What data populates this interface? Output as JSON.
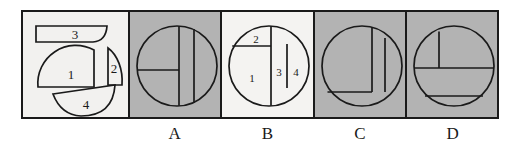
{
  "figure": {
    "type": "visual-puzzle",
    "colors": {
      "ink": "#1a1a1a",
      "paper": "#ffffff",
      "panel_light": "#f4f3f1",
      "panel_shaded": "#b3b3b3",
      "piece_fill": "#f2f1ef"
    }
  },
  "prompt_panel": {
    "name": "pieces-panel",
    "shaded": false,
    "pieces": [
      {
        "id": "piece-1",
        "label": "1",
        "shape": "quarter-disk-with-flat-right",
        "cx": 48,
        "cy": 62
      },
      {
        "id": "piece-2",
        "label": "2",
        "shape": "small-wedge",
        "cx": 92,
        "cy": 57
      },
      {
        "id": "piece-3",
        "label": "3",
        "shape": "thin-circular-segment",
        "cx": 52,
        "cy": 22
      },
      {
        "id": "piece-4",
        "label": "4",
        "shape": "circular-segment",
        "cx": 63,
        "cy": 94
      }
    ]
  },
  "options": [
    {
      "id": "option-a",
      "label": "A",
      "shaded": true,
      "circle": {
        "cx": 47,
        "cy": 54,
        "r": 40
      },
      "cuts": [
        {
          "kind": "vertical-chord",
          "x": 49,
          "note": "full chord just right of center"
        },
        {
          "kind": "horizontal-segment",
          "y": 58,
          "note": "from left circle edge to center chord"
        },
        {
          "kind": "vertical-chord",
          "x": 64,
          "note": "shorter chord on the right"
        }
      ],
      "region_labels": []
    },
    {
      "id": "option-b",
      "label": "B",
      "shaded": false,
      "circle": {
        "cx": 47,
        "cy": 54,
        "r": 40
      },
      "cuts": [
        {
          "kind": "vertical-chord",
          "x": 49,
          "note": "full chord just right of center"
        },
        {
          "kind": "horizontal-segment",
          "y": 34,
          "note": "from left circle edge to center chord"
        },
        {
          "kind": "vertical-chord",
          "x": 65,
          "note": "shorter chord on the right"
        }
      ],
      "region_labels": [
        {
          "text": "1",
          "x": 30,
          "y": 66
        },
        {
          "text": "2",
          "x": 34,
          "y": 28
        },
        {
          "text": "3",
          "x": 56,
          "y": 60
        },
        {
          "text": "4",
          "x": 73,
          "y": 60
        }
      ]
    },
    {
      "id": "option-c",
      "label": "C",
      "shaded": true,
      "circle": {
        "cx": 47,
        "cy": 54,
        "r": 40
      },
      "cuts": [
        {
          "kind": "vertical-chord",
          "x": 57,
          "note": "chord right of center"
        },
        {
          "kind": "horizontal-segment",
          "y": 76,
          "note": "low horizontal from left edge"
        },
        {
          "kind": "vertical-chord",
          "x": 70,
          "note": "short chord far right"
        }
      ],
      "region_labels": []
    },
    {
      "id": "option-d",
      "label": "D",
      "shaded": true,
      "circle": {
        "cx": 47,
        "cy": 54,
        "r": 40
      },
      "cuts": [
        {
          "kind": "horizontal-chord",
          "y": 56,
          "note": "full horizontal through middle"
        },
        {
          "kind": "vertical-segment",
          "x": 32,
          "note": "short vertical in upper-left"
        },
        {
          "kind": "horizontal-chord",
          "y": 84,
          "note": "lower horizontal chord"
        }
      ],
      "region_labels": []
    }
  ],
  "answer_labels": [
    "A",
    "B",
    "C",
    "D"
  ]
}
